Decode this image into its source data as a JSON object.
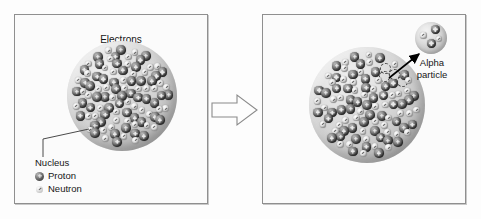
{
  "diagram": {
    "panels": [
      {
        "id": "before",
        "labels": {
          "electrons": "Electrons",
          "nucleus": "Nucleus"
        },
        "legend": [
          {
            "marker": "proton-sphere-icon",
            "label": "Proton"
          },
          {
            "marker": "neutron-sphere-icon",
            "label": "Neutron"
          }
        ]
      },
      {
        "id": "after",
        "labels": {
          "alpha_particle": "Alpha particle"
        },
        "alpha_particle": {
          "protons": 2,
          "neutrons": 2,
          "vacancies": 4
        }
      }
    ],
    "transition_arrow": "block-arrow-right",
    "colors": {
      "panel_border": "#8f8f8f",
      "panel_background": "#fbfbfb",
      "nucleus_sphere": "#cfcfcf",
      "proton": "#3a3a3a",
      "neutron": "#e0e0e0",
      "arrow": "#000000",
      "text": "#161616"
    }
  }
}
